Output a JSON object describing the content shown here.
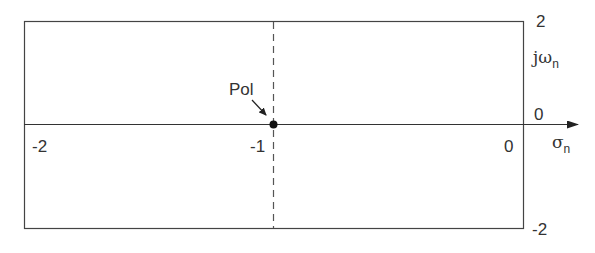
{
  "diagram": {
    "type": "s-plane pole plot",
    "axes": {
      "real_axis_label": "σ",
      "real_axis_subscript": "n",
      "imag_axis_label": "jω",
      "imag_axis_subscript": "n",
      "x_ticks": [
        "-2",
        "-1",
        "0"
      ],
      "y_ticks": [
        "2",
        "0",
        "-2"
      ]
    },
    "pole": {
      "label": "Pol",
      "x": -1,
      "y": 0
    },
    "colors": {
      "line": "#333333",
      "background": "#ffffff"
    }
  }
}
